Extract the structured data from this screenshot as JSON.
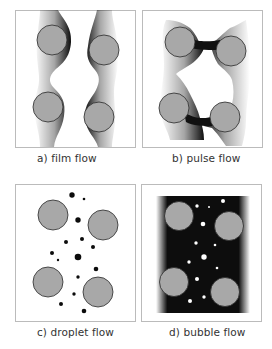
{
  "figure": {
    "panels": [
      {
        "id": "a",
        "label": "a) film flow",
        "type": "film"
      },
      {
        "id": "b",
        "label": "b) pulse flow",
        "type": "pulse"
      },
      {
        "id": "c",
        "label": "c) droplet flow",
        "type": "droplet"
      },
      {
        "id": "d",
        "label": "d) bubble flow",
        "type": "bubble"
      }
    ]
  },
  "colors": {
    "particle_fill": "#a8a8a8",
    "particle_stroke": "#2a2a2a",
    "liquid": "#0c0c0c",
    "frame": "#b8b8b8",
    "background": "#ffffff"
  }
}
